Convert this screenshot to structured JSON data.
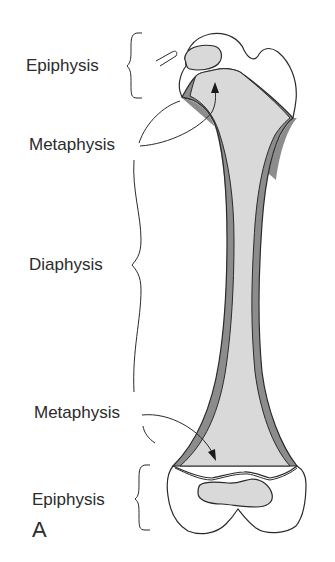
{
  "diagram": {
    "panel_letter": "A",
    "labels": {
      "epiphysis_top": "Epiphysis",
      "metaphysis_top": "Metaphysis",
      "diaphysis": "Diaphysis",
      "metaphysis_bottom": "Metaphysis",
      "epiphysis_bottom": "Epiphysis"
    },
    "colors": {
      "outline": "#2a2a2a",
      "marrow_fill": "#d9d9d9",
      "cortex_fill": "#8c8c8c",
      "epiphysis_fill": "#ffffff",
      "text": "#2b2b2b",
      "background": "#ffffff"
    }
  }
}
